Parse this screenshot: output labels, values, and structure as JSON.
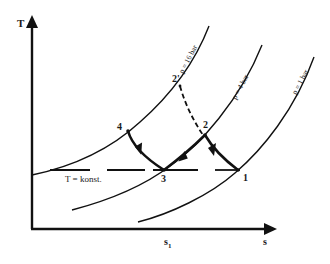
{
  "diagram": {
    "type": "T-s diagram",
    "axes": {
      "y_label": "T",
      "x_label": "s",
      "x_tick_label": "s",
      "x_tick_sub": "1"
    },
    "isobars": [
      {
        "label": "p = 16 bar"
      },
      {
        "label": "p = 4 bar"
      },
      {
        "label": "p = 1 bar"
      }
    ],
    "isotherm_label": "T = konst.",
    "points": {
      "p1": "1",
      "p2": "2",
      "p2prime": "2'",
      "p3": "3",
      "p4": "4"
    }
  },
  "colors": {
    "ink": "#111111",
    "background": "#ffffff"
  }
}
